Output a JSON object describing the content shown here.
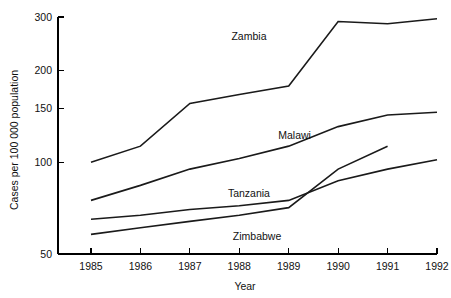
{
  "chart_data": {
    "type": "line",
    "title": "",
    "xlabel": "Year",
    "ylabel": "Cases per 100 000 population",
    "yscale": "log",
    "ylim": [
      50,
      300
    ],
    "xlim": [
      1985,
      1992
    ],
    "grid": false,
    "legend_position": "inline-labels",
    "x": [
      1985,
      1986,
      1987,
      1988,
      1989,
      1990,
      1991,
      1992
    ],
    "yticks": [
      50,
      100,
      150,
      200,
      300
    ],
    "ytick_labels": [
      "50",
      "100",
      "150",
      "200",
      "300"
    ],
    "xticks": [
      1985,
      1986,
      1987,
      1988,
      1989,
      1990,
      1991,
      1992
    ],
    "xtick_labels": [
      "1985",
      "1986",
      "1987",
      "1988",
      "1989",
      "1990",
      "1991",
      "1992"
    ],
    "series": [
      {
        "name": "Zambia",
        "x": [
          1985,
          1986,
          1987,
          1988,
          1989,
          1990,
          1991,
          1992
        ],
        "values": [
          100,
          113,
          156,
          167,
          178,
          290,
          285,
          296
        ],
        "label": "Zambia"
      },
      {
        "name": "Malawi",
        "x": [
          1985,
          1986,
          1987,
          1988,
          1989,
          1990,
          1991,
          1992
        ],
        "values": [
          75,
          84,
          95,
          103,
          113,
          131,
          143,
          146
        ],
        "label": "Malawi"
      },
      {
        "name": "Tanzania",
        "x": [
          1985,
          1986,
          1987,
          1988,
          1989,
          1990,
          1991,
          1992
        ],
        "values": [
          65,
          67,
          70,
          72,
          75,
          87,
          95,
          102
        ],
        "label": "Tanzania"
      },
      {
        "name": "Zimbabwe",
        "x": [
          1985,
          1986,
          1987,
          1988,
          1989,
          1990,
          1991
        ],
        "values": [
          58,
          61,
          64,
          67,
          71,
          95,
          113
        ],
        "label": "Zimbabwe"
      }
    ],
    "annotations": [
      {
        "text": "Zambia",
        "x": 1988.55,
        "y": 252,
        "anchor": "end"
      },
      {
        "text": "Malawi",
        "x": 1989.45,
        "y": 119,
        "anchor": "end"
      },
      {
        "text": "Tanzania",
        "x": 1988.62,
        "y": 77,
        "anchor": "end"
      },
      {
        "text": "Zimbabwe",
        "x": 1988.85,
        "y": 55.5,
        "anchor": "end"
      }
    ],
    "colors": {
      "line": "#1a1a1a",
      "axis": "#000000",
      "text": "#111111",
      "background": "#ffffff"
    }
  }
}
